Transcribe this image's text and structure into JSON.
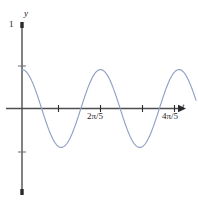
{
  "figure": {
    "title": "",
    "background_color": "#ffffff"
  },
  "axes": {
    "y_axis_label": "y",
    "x_axis_label": "t",
    "y_tick_labels": [
      "1"
    ],
    "x_tick_labels": [
      "2π/5",
      "4π/5"
    ],
    "axis_color": "#4d4d52",
    "label_color": "#1a1a1a"
  },
  "chart_data": {
    "type": "line",
    "title": "",
    "xlabel": "t",
    "ylabel": "y",
    "xlim": [
      0,
      0.9424777960769379
    ],
    "ylim": [
      -1,
      1
    ],
    "grid": false,
    "legend": null,
    "curve_color": "#8fa0c4",
    "x_ticks": [
      0.41887902047863906,
      0.8377580409572782
    ],
    "x_tick_labels": [
      "2π/5",
      "4π/5"
    ],
    "y_ticks": [
      1,
      0.45,
      0,
      -0.45,
      -1
    ],
    "y_tick_labels": [
      "1",
      "",
      "",
      "",
      ""
    ],
    "series": [
      {
        "name": "y = 0.45 cos(15t)",
        "amplitude": 0.45,
        "period": 0.41887902047863906,
        "phase": 0,
        "form": "cosine",
        "x": [
          0.0,
          0.0209,
          0.0419,
          0.0628,
          0.0838,
          0.1047,
          0.1257,
          0.1466,
          0.1676,
          0.1885,
          0.2094,
          0.2304,
          0.2513,
          0.2723,
          0.2932,
          0.3142,
          0.3351,
          0.356,
          0.377,
          0.3979,
          0.4189,
          0.4398,
          0.4608,
          0.4817,
          0.5027,
          0.5236,
          0.5445,
          0.5655,
          0.5864,
          0.6074,
          0.6283,
          0.6492,
          0.6702,
          0.6911,
          0.7121,
          0.733,
          0.754,
          0.7749,
          0.7959,
          0.8168,
          0.8378,
          0.8587,
          0.8796,
          0.9006,
          0.9215,
          0.9425
        ],
        "y": [
          0.45,
          0.428,
          0.364,
          0.265,
          0.139,
          0.0,
          -0.139,
          -0.265,
          -0.364,
          -0.428,
          -0.45,
          -0.428,
          -0.364,
          -0.265,
          -0.139,
          0.0,
          0.139,
          0.265,
          0.364,
          0.428,
          0.45,
          0.428,
          0.364,
          0.265,
          0.139,
          0.0,
          -0.139,
          -0.265,
          -0.364,
          -0.428,
          -0.45,
          -0.428,
          -0.364,
          -0.265,
          -0.139,
          0.0,
          0.139,
          0.265,
          0.364,
          0.428,
          0.45,
          0.428,
          0.364,
          0.265,
          0.139,
          0.45
        ]
      }
    ]
  }
}
